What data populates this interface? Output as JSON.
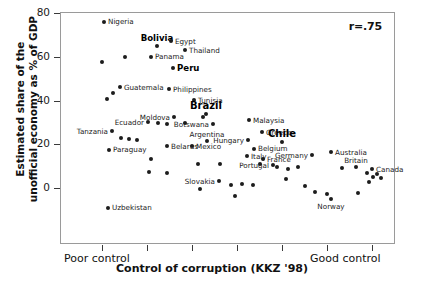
{
  "chart_data": {
    "type": "scatter",
    "title": "",
    "xlabel": "Control of corruption (KKZ '98)",
    "ylabel": "Estimated share of the unofficial economy as % of GDP",
    "ylabel_line1": "Estimated share of the",
    "ylabel_line2": "unofficial economy as % of GDP",
    "annotation": "r=.75",
    "grid": false,
    "legend": "none",
    "ylim": [
      -12,
      80
    ],
    "yticks": [
      0,
      20,
      40,
      60,
      80
    ],
    "ytick_labels": [
      "0",
      "20",
      "40",
      "60",
      "80"
    ],
    "xaxis_endpoint_labels": {
      "low": "Poor control",
      "high": "Good control"
    },
    "xticks_count": 7,
    "xlim_note": "unitless KKZ corruption-control index, increasing left to right",
    "points": [
      {
        "label": "Nigeria",
        "label_pos": "right",
        "emphasis": "normal",
        "x": 103,
        "y": 76.5
      },
      {
        "label": "",
        "label_pos": "none",
        "emphasis": "normal",
        "x": 101,
        "y": 58.0
      },
      {
        "label": "Bolivia",
        "label_pos": "above",
        "emphasis": "bold",
        "x": 156,
        "y": 65.5
      },
      {
        "label": "Egypt",
        "label_pos": "right",
        "emphasis": "normal",
        "x": 170,
        "y": 67.5
      },
      {
        "label": "Thailand",
        "label_pos": "right",
        "emphasis": "normal",
        "x": 184,
        "y": 63.5
      },
      {
        "label": "Panama",
        "label_pos": "right",
        "emphasis": "normal",
        "x": 150,
        "y": 60.5
      },
      {
        "label": "",
        "label_pos": "none",
        "emphasis": "normal",
        "x": 124,
        "y": 60.5
      },
      {
        "label": "Peru",
        "label_pos": "right",
        "emphasis": "bold",
        "x": 172,
        "y": 55.5
      },
      {
        "label": "Guatemala",
        "label_pos": "right",
        "emphasis": "normal",
        "x": 119,
        "y": 46.5
      },
      {
        "label": "",
        "label_pos": "none",
        "emphasis": "normal",
        "x": 112,
        "y": 44.0
      },
      {
        "label": "",
        "label_pos": "none",
        "emphasis": "normal",
        "x": 106,
        "y": 41.0
      },
      {
        "label": "Philippines",
        "label_pos": "right",
        "emphasis": "normal",
        "x": 168,
        "y": 45.5
      },
      {
        "label": "Tunisia",
        "label_pos": "right",
        "emphasis": "normal",
        "x": 193,
        "y": 40.5
      },
      {
        "label": "Brazil",
        "label_pos": "above",
        "emphasis": "big",
        "x": 205,
        "y": 34.5
      },
      {
        "label": "",
        "label_pos": "none",
        "emphasis": "normal",
        "x": 202,
        "y": 33.0
      },
      {
        "label": "Moldova",
        "label_pos": "left",
        "emphasis": "normal",
        "x": 173,
        "y": 33.0
      },
      {
        "label": "Ecuador",
        "label_pos": "left",
        "emphasis": "normal",
        "x": 147,
        "y": 30.5
      },
      {
        "label": "",
        "label_pos": "none",
        "emphasis": "normal",
        "x": 157,
        "y": 30.0
      },
      {
        "label": "",
        "label_pos": "none",
        "emphasis": "normal",
        "x": 166,
        "y": 29.5
      },
      {
        "label": "",
        "label_pos": "none",
        "emphasis": "normal",
        "x": 184,
        "y": 30.0
      },
      {
        "label": "Botswana",
        "label_pos": "left",
        "emphasis": "normal",
        "x": 212,
        "y": 29.5
      },
      {
        "label": "Malaysia",
        "label_pos": "right",
        "emphasis": "normal",
        "x": 248,
        "y": 31.5
      },
      {
        "label": "Tanzania",
        "label_pos": "left",
        "emphasis": "normal",
        "x": 111,
        "y": 26.5
      },
      {
        "label": "",
        "label_pos": "none",
        "emphasis": "normal",
        "x": 120,
        "y": 23.5
      },
      {
        "label": "",
        "label_pos": "none",
        "emphasis": "normal",
        "x": 128,
        "y": 23.0
      },
      {
        "label": "",
        "label_pos": "none",
        "emphasis": "normal",
        "x": 136,
        "y": 22.5
      },
      {
        "label": "Greece",
        "label_pos": "right",
        "emphasis": "normal",
        "x": 261,
        "y": 26.0
      },
      {
        "label": "Argentina",
        "label_pos": "above",
        "emphasis": "normal",
        "x": 206,
        "y": 22.0
      },
      {
        "label": "Hungary",
        "label_pos": "left",
        "emphasis": "normal",
        "x": 247,
        "y": 22.5
      },
      {
        "label": "Chile",
        "label_pos": "above",
        "emphasis": "big",
        "x": 281,
        "y": 21.5
      },
      {
        "label": "Paraguay",
        "label_pos": "right",
        "emphasis": "normal",
        "x": 108,
        "y": 18.0
      },
      {
        "label": "Belarus",
        "label_pos": "right",
        "emphasis": "normal",
        "x": 166,
        "y": 19.5
      },
      {
        "label": "Mexico",
        "label_pos": "right",
        "emphasis": "normal",
        "x": 191,
        "y": 19.5
      },
      {
        "label": "Belgium",
        "label_pos": "right",
        "emphasis": "normal",
        "x": 253,
        "y": 18.5
      },
      {
        "label": "Australia",
        "label_pos": "right",
        "emphasis": "normal",
        "x": 330,
        "y": 17.0
      },
      {
        "label": "Germany",
        "label_pos": "left",
        "emphasis": "normal",
        "x": 311,
        "y": 15.5
      },
      {
        "label": "Italy",
        "label_pos": "right",
        "emphasis": "normal",
        "x": 246,
        "y": 15.0
      },
      {
        "label": "France",
        "label_pos": "right",
        "emphasis": "normal",
        "x": 262,
        "y": 13.5
      },
      {
        "label": "",
        "label_pos": "none",
        "emphasis": "normal",
        "x": 150,
        "y": 13.5
      },
      {
        "label": "",
        "label_pos": "none",
        "emphasis": "normal",
        "x": 197,
        "y": 11.5
      },
      {
        "label": "",
        "label_pos": "none",
        "emphasis": "normal",
        "x": 219,
        "y": 11.5
      },
      {
        "label": "",
        "label_pos": "none",
        "emphasis": "normal",
        "x": 259,
        "y": 11.5
      },
      {
        "label": "Portugal",
        "label_pos": "left",
        "emphasis": "normal",
        "x": 272,
        "y": 11.0
      },
      {
        "label": "",
        "label_pos": "none",
        "emphasis": "normal",
        "x": 276,
        "y": 10.0
      },
      {
        "label": "Britain",
        "label_pos": "above",
        "emphasis": "normal",
        "x": 355,
        "y": 10.0
      },
      {
        "label": "",
        "label_pos": "none",
        "emphasis": "normal",
        "x": 341,
        "y": 9.5
      },
      {
        "label": "",
        "label_pos": "none",
        "emphasis": "normal",
        "x": 287,
        "y": 9.0
      },
      {
        "label": "",
        "label_pos": "none",
        "emphasis": "normal",
        "x": 297,
        "y": 10.0
      },
      {
        "label": "Canada",
        "label_pos": "right",
        "emphasis": "normal",
        "x": 371,
        "y": 9.0
      },
      {
        "label": "",
        "label_pos": "none",
        "emphasis": "normal",
        "x": 366,
        "y": 7.5
      },
      {
        "label": "",
        "label_pos": "none",
        "emphasis": "normal",
        "x": 376,
        "y": 7.0
      },
      {
        "label": "",
        "label_pos": "none",
        "emphasis": "normal",
        "x": 372,
        "y": 5.5
      },
      {
        "label": "",
        "label_pos": "none",
        "emphasis": "normal",
        "x": 380,
        "y": 5.0
      },
      {
        "label": "",
        "label_pos": "none",
        "emphasis": "normal",
        "x": 368,
        "y": 3.0
      },
      {
        "label": "",
        "label_pos": "none",
        "emphasis": "normal",
        "x": 148,
        "y": 8.0
      },
      {
        "label": "",
        "label_pos": "none",
        "emphasis": "normal",
        "x": 166,
        "y": 7.5
      },
      {
        "label": "",
        "label_pos": "none",
        "emphasis": "normal",
        "x": 285,
        "y": 4.5
      },
      {
        "label": "Slovakia",
        "label_pos": "left",
        "emphasis": "normal",
        "x": 218,
        "y": 3.5
      },
      {
        "label": "",
        "label_pos": "none",
        "emphasis": "normal",
        "x": 230,
        "y": 2.0
      },
      {
        "label": "",
        "label_pos": "none",
        "emphasis": "normal",
        "x": 241,
        "y": 2.5
      },
      {
        "label": "",
        "label_pos": "none",
        "emphasis": "normal",
        "x": 252,
        "y": 2.0
      },
      {
        "label": "",
        "label_pos": "none",
        "emphasis": "normal",
        "x": 199,
        "y": 0.0
      },
      {
        "label": "",
        "label_pos": "none",
        "emphasis": "normal",
        "x": 304,
        "y": 1.5
      },
      {
        "label": "",
        "label_pos": "none",
        "emphasis": "normal",
        "x": 314,
        "y": -1.5
      },
      {
        "label": "",
        "label_pos": "none",
        "emphasis": "normal",
        "x": 326,
        "y": -2.5
      },
      {
        "label": "Norway",
        "label_pos": "below",
        "emphasis": "normal",
        "x": 330,
        "y": -4.5
      },
      {
        "label": "",
        "label_pos": "none",
        "emphasis": "normal",
        "x": 357,
        "y": -2.0
      },
      {
        "label": "",
        "label_pos": "none",
        "emphasis": "normal",
        "x": 234,
        "y": -3.0
      },
      {
        "label": "Uzbekistan",
        "label_pos": "right",
        "emphasis": "normal",
        "x": 107,
        "y": -8.5
      }
    ]
  }
}
